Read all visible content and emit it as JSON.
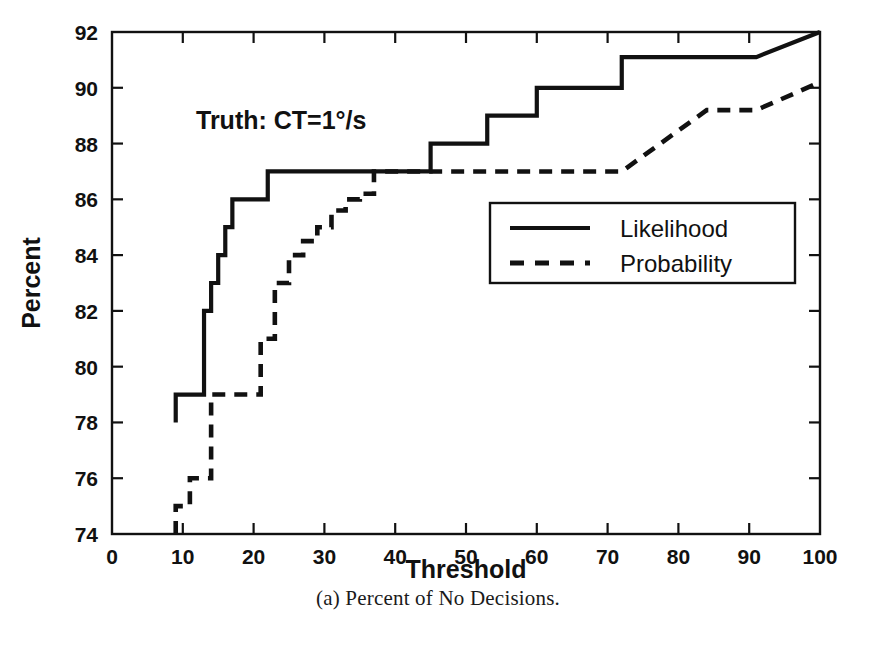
{
  "caption": "(a) Percent of No Decisions.",
  "annotation": "Truth: CT=1°/s",
  "axis": {
    "xlabel": "Threshold",
    "ylabel": "Percent",
    "xticks": [
      "0",
      "10",
      "20",
      "30",
      "40",
      "50",
      "60",
      "70",
      "80",
      "90",
      "100"
    ],
    "yticks": [
      "74",
      "76",
      "78",
      "80",
      "82",
      "84",
      "86",
      "88",
      "90",
      "92"
    ]
  },
  "legend": {
    "items": [
      {
        "label": "Likelihood",
        "style": "solid"
      },
      {
        "label": "Probability",
        "style": "dashed"
      }
    ]
  },
  "colors": {
    "ink": "#111111",
    "background": "#ffffff"
  },
  "chart_data": {
    "type": "line",
    "title": "",
    "xlabel": "Threshold",
    "ylabel": "Percent",
    "xlim": [
      0,
      100
    ],
    "ylim": [
      74,
      92
    ],
    "xticks": [
      0,
      10,
      20,
      30,
      40,
      50,
      60,
      70,
      80,
      90,
      100
    ],
    "yticks": [
      74,
      76,
      78,
      80,
      82,
      84,
      86,
      88,
      90,
      92
    ],
    "grid": false,
    "legend_position": "center-right",
    "annotations": [
      {
        "text": "Truth: CT=1°/s",
        "x": 18,
        "y": 89.1
      }
    ],
    "series": [
      {
        "name": "Likelihood",
        "style": "solid",
        "drawstyle": "steps-post",
        "x": [
          9,
          9,
          13,
          13,
          14,
          14,
          15,
          15,
          16,
          16,
          17,
          17,
          20,
          20,
          22,
          22,
          24,
          24,
          45,
          45,
          49,
          49,
          53,
          53,
          57,
          57,
          60,
          60,
          68,
          68,
          72,
          72,
          91,
          100
        ],
        "y": [
          78,
          79,
          79,
          82,
          82,
          83,
          83,
          84,
          84,
          85,
          85,
          86,
          86,
          86,
          86,
          87,
          87,
          87,
          87,
          88,
          88,
          88,
          88,
          89,
          89,
          89,
          89,
          90,
          90,
          90,
          90,
          91.1,
          91.1,
          92
        ]
      },
      {
        "name": "Probability",
        "style": "dashed",
        "drawstyle": "steps-post",
        "x": [
          9,
          9,
          11,
          11,
          13,
          13,
          14,
          14,
          17,
          17,
          21,
          21,
          23,
          23,
          25,
          25,
          27,
          27,
          29,
          29,
          31,
          31,
          33,
          33,
          35,
          35,
          37,
          37,
          72,
          84,
          91,
          100
        ],
        "y": [
          74,
          75,
          75,
          76,
          76,
          76,
          76,
          79,
          79,
          79,
          79,
          81,
          81,
          83,
          83,
          84,
          84,
          84.5,
          84.5,
          85,
          85,
          85.6,
          85.6,
          86,
          86,
          86.2,
          86.2,
          87,
          87,
          89.2,
          89.2,
          90.2
        ]
      }
    ]
  }
}
